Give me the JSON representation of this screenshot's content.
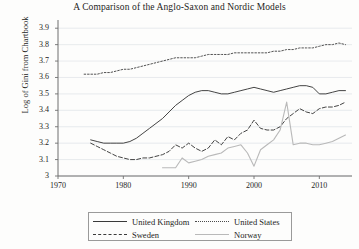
{
  "chart_data": {
    "type": "line",
    "title": "A Comparison of the Anglo-Saxon and Nordic Models",
    "xlabel": "",
    "ylabel": "Log of Gini from Chartbook",
    "xlim": [
      1970,
      2015
    ],
    "ylim": [
      3.0,
      3.95
    ],
    "xticks": [
      1970,
      1980,
      1990,
      2000,
      2010
    ],
    "xtick_labels": [
      "1970",
      "1980",
      "1990",
      "2000",
      "2010"
    ],
    "yticks": [
      3,
      3.1,
      3.2,
      3.3,
      3.4,
      3.5,
      3.6,
      3.7,
      3.8,
      3.9
    ],
    "ytick_labels": [
      "3",
      "3.1",
      "3.2",
      "3.3",
      "3.4",
      "3.5",
      "3.6",
      "3.7",
      "3.8",
      "3.9"
    ],
    "grid": true,
    "grid_axis": "y",
    "legend_position": "below-axes",
    "series": [
      {
        "name": "United Kingdom",
        "style": "solid",
        "color": "#3a3a3a",
        "x": [
          1975,
          1976,
          1977,
          1978,
          1979,
          1980,
          1981,
          1982,
          1983,
          1984,
          1985,
          1986,
          1987,
          1988,
          1989,
          1990,
          1991,
          1992,
          1993,
          1994,
          1995,
          1996,
          1997,
          1998,
          1999,
          2000,
          2001,
          2002,
          2003,
          2004,
          2005,
          2006,
          2007,
          2008,
          2009,
          2010,
          2011,
          2012,
          2013,
          2014
        ],
        "y": [
          3.22,
          3.21,
          3.2,
          3.2,
          3.2,
          3.2,
          3.21,
          3.23,
          3.26,
          3.29,
          3.32,
          3.35,
          3.39,
          3.43,
          3.46,
          3.49,
          3.51,
          3.52,
          3.52,
          3.51,
          3.5,
          3.5,
          3.51,
          3.52,
          3.53,
          3.54,
          3.53,
          3.52,
          3.51,
          3.52,
          3.53,
          3.54,
          3.55,
          3.55,
          3.54,
          3.5,
          3.5,
          3.51,
          3.52,
          3.52
        ]
      },
      {
        "name": "United States",
        "style": "dotted",
        "color": "#4a4a4a",
        "x": [
          1974,
          1975,
          1976,
          1977,
          1978,
          1979,
          1980,
          1981,
          1982,
          1983,
          1984,
          1985,
          1986,
          1987,
          1988,
          1989,
          1990,
          1991,
          1992,
          1993,
          1994,
          1995,
          1996,
          1997,
          1998,
          1999,
          2000,
          2001,
          2002,
          2003,
          2004,
          2005,
          2006,
          2007,
          2008,
          2009,
          2010,
          2011,
          2012,
          2013,
          2014
        ],
        "y": [
          3.62,
          3.62,
          3.62,
          3.63,
          3.63,
          3.64,
          3.65,
          3.65,
          3.66,
          3.67,
          3.68,
          3.69,
          3.7,
          3.71,
          3.72,
          3.72,
          3.72,
          3.72,
          3.73,
          3.74,
          3.74,
          3.74,
          3.74,
          3.75,
          3.75,
          3.75,
          3.75,
          3.75,
          3.75,
          3.76,
          3.76,
          3.77,
          3.77,
          3.78,
          3.78,
          3.78,
          3.79,
          3.8,
          3.8,
          3.81,
          3.8
        ]
      },
      {
        "name": "Sweden",
        "style": "dashed",
        "color": "#3a3a3a",
        "x": [
          1975,
          1976,
          1977,
          1978,
          1979,
          1980,
          1981,
          1982,
          1983,
          1984,
          1985,
          1986,
          1987,
          1988,
          1989,
          1990,
          1991,
          1992,
          1993,
          1994,
          1995,
          1996,
          1997,
          1998,
          1999,
          2000,
          2001,
          2002,
          2003,
          2004,
          2005,
          2006,
          2007,
          2008,
          2009,
          2010,
          2011,
          2012,
          2013,
          2014
        ],
        "y": [
          3.2,
          3.18,
          3.16,
          3.14,
          3.12,
          3.11,
          3.1,
          3.1,
          3.11,
          3.11,
          3.12,
          3.13,
          3.15,
          3.19,
          3.17,
          3.2,
          3.17,
          3.15,
          3.17,
          3.22,
          3.19,
          3.24,
          3.22,
          3.26,
          3.28,
          3.34,
          3.29,
          3.28,
          3.28,
          3.3,
          3.35,
          3.38,
          3.41,
          3.39,
          3.38,
          3.41,
          3.42,
          3.42,
          3.43,
          3.45
        ]
      },
      {
        "name": "Norway",
        "style": "solid-light",
        "color": "#b9b9b9",
        "x": [
          1986,
          1987,
          1988,
          1989,
          1990,
          1991,
          1992,
          1993,
          1994,
          1995,
          1996,
          1997,
          1998,
          1999,
          2000,
          2001,
          2002,
          2003,
          2004,
          2005,
          2006,
          2007,
          2008,
          2009,
          2010,
          2011,
          2012,
          2013,
          2014
        ],
        "y": [
          3.05,
          3.05,
          3.05,
          3.11,
          3.08,
          3.09,
          3.1,
          3.12,
          3.13,
          3.14,
          3.17,
          3.18,
          3.19,
          3.14,
          3.06,
          3.16,
          3.19,
          3.22,
          3.28,
          3.45,
          3.19,
          3.2,
          3.2,
          3.19,
          3.19,
          3.2,
          3.21,
          3.23,
          3.25
        ]
      }
    ]
  },
  "legend": {
    "entries": [
      {
        "label": "United Kingdom",
        "style": "solid"
      },
      {
        "label": "United States",
        "style": "dotted"
      },
      {
        "label": "Sweden",
        "style": "dashed"
      },
      {
        "label": "Norway",
        "style": "solid-light"
      }
    ]
  }
}
